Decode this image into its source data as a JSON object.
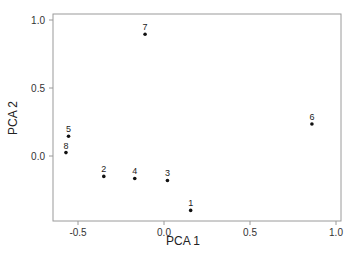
{
  "chart_data": {
    "type": "scatter",
    "title": "",
    "xlabel": "PCA 1",
    "ylabel": "PCA 2",
    "xlim": [
      -0.65,
      1.03
    ],
    "ylim": [
      -0.47,
      1.04
    ],
    "x_ticks": [
      -0.5,
      0.0,
      0.5,
      1.0
    ],
    "x_tick_labels": [
      "-0.5",
      "0.0",
      "0.5",
      "1.0"
    ],
    "y_ticks": [
      0.0,
      0.5,
      1.0
    ],
    "y_tick_labels": [
      "0.0",
      "0.5",
      "1.0"
    ],
    "grid": false,
    "legend": null,
    "points": [
      {
        "label": "1",
        "x": 0.155,
        "y": -0.4
      },
      {
        "label": "2",
        "x": -0.35,
        "y": -0.15
      },
      {
        "label": "3",
        "x": 0.02,
        "y": -0.18
      },
      {
        "label": "4",
        "x": -0.17,
        "y": -0.165
      },
      {
        "label": "5",
        "x": -0.555,
        "y": 0.145
      },
      {
        "label": "6",
        "x": 0.86,
        "y": 0.235
      },
      {
        "label": "7",
        "x": -0.11,
        "y": 0.895
      },
      {
        "label": "8",
        "x": -0.57,
        "y": 0.025
      }
    ]
  },
  "layout": {
    "frame": {
      "left": 53,
      "top": 14,
      "right": 341,
      "bottom": 221
    },
    "x_origin_px": 164,
    "x_scale_px": 172,
    "y_origin_px": 156,
    "y_scale_px": 136
  }
}
